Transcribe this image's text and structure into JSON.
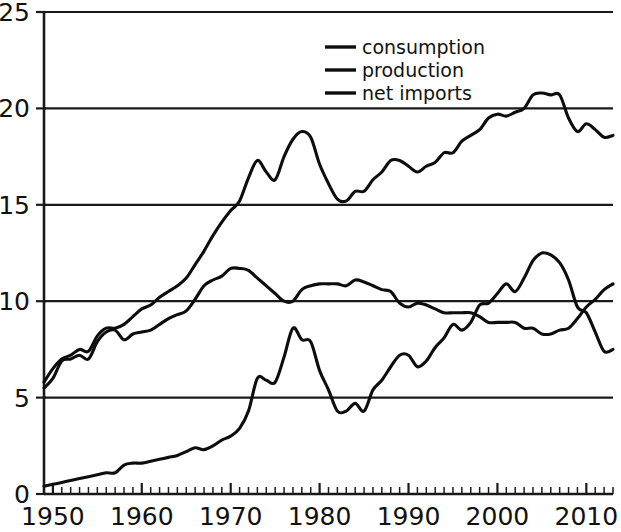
{
  "chart_data": {
    "type": "line",
    "title": "",
    "subtitle": "",
    "xlabel": "",
    "ylabel": "",
    "xlim": [
      1949,
      2013
    ],
    "ylim": [
      0,
      25
    ],
    "grid": true,
    "grid_axis": "y",
    "legend_position": "top-center",
    "y_ticks": [
      "0",
      "5",
      "10",
      "15",
      "20",
      "25"
    ],
    "y_tick_values": [
      0,
      5,
      10,
      15,
      20,
      25
    ],
    "x_ticks": [
      "1950",
      "1960",
      "1970",
      "1980",
      "1990",
      "2000",
      "2010"
    ],
    "x_tick_values": [
      1950,
      1960,
      1970,
      1980,
      1990,
      2000,
      2010
    ],
    "x_minor_tick_step": 1,
    "x": [
      1949,
      1950,
      1951,
      1952,
      1953,
      1954,
      1955,
      1956,
      1957,
      1958,
      1959,
      1960,
      1961,
      1962,
      1963,
      1964,
      1965,
      1966,
      1967,
      1968,
      1969,
      1970,
      1971,
      1972,
      1973,
      1974,
      1975,
      1976,
      1977,
      1978,
      1979,
      1980,
      1981,
      1982,
      1983,
      1984,
      1985,
      1986,
      1987,
      1988,
      1989,
      1990,
      1991,
      1992,
      1993,
      1994,
      1995,
      1996,
      1997,
      1998,
      1999,
      2000,
      2001,
      2002,
      2003,
      2004,
      2005,
      2006,
      2007,
      2008,
      2009,
      2010,
      2011,
      2012,
      2013
    ],
    "series": [
      {
        "name": "consumption",
        "color": "#0d0d0d",
        "values": [
          5.8,
          6.5,
          7.0,
          7.2,
          7.5,
          7.4,
          8.2,
          8.6,
          8.6,
          8.8,
          9.2,
          9.6,
          9.8,
          10.2,
          10.5,
          10.8,
          11.2,
          11.9,
          12.6,
          13.4,
          14.1,
          14.7,
          15.2,
          16.4,
          17.3,
          16.7,
          16.3,
          17.5,
          18.4,
          18.8,
          18.5,
          17.1,
          16.1,
          15.3,
          15.2,
          15.7,
          15.7,
          16.3,
          16.7,
          17.3,
          17.3,
          17.0,
          16.7,
          17.0,
          17.2,
          17.7,
          17.7,
          18.3,
          18.6,
          18.9,
          19.5,
          19.7,
          19.6,
          19.8,
          20.0,
          20.7,
          20.8,
          20.7,
          20.7,
          19.5,
          18.8,
          19.2,
          18.9,
          18.5,
          18.6
        ]
      },
      {
        "name": "production",
        "color": "#0d0d0d",
        "values": [
          5.5,
          6.0,
          6.9,
          7.0,
          7.2,
          7.0,
          7.9,
          8.4,
          8.5,
          8.0,
          8.3,
          8.4,
          8.5,
          8.8,
          9.1,
          9.3,
          9.5,
          10.1,
          10.8,
          11.1,
          11.3,
          11.7,
          11.7,
          11.6,
          11.2,
          10.8,
          10.4,
          10.0,
          10.0,
          10.6,
          10.8,
          10.9,
          10.9,
          10.9,
          10.8,
          11.1,
          11.0,
          10.8,
          10.6,
          10.5,
          9.9,
          9.7,
          9.9,
          9.8,
          9.6,
          9.4,
          9.4,
          9.4,
          9.4,
          9.2,
          8.9,
          8.9,
          8.9,
          8.9,
          8.6,
          8.6,
          8.3,
          8.3,
          8.5,
          8.6,
          9.1,
          9.7,
          10.1,
          10.6,
          10.9
        ]
      },
      {
        "name": "net imports",
        "color": "#0d0d0d",
        "values": [
          0.4,
          0.5,
          0.6,
          0.7,
          0.8,
          0.9,
          1.0,
          1.1,
          1.1,
          1.5,
          1.6,
          1.6,
          1.7,
          1.8,
          1.9,
          2.0,
          2.2,
          2.4,
          2.3,
          2.5,
          2.8,
          3.0,
          3.4,
          4.3,
          6.0,
          5.9,
          5.8,
          7.1,
          8.6,
          8.0,
          7.9,
          6.4,
          5.4,
          4.3,
          4.3,
          4.7,
          4.3,
          5.4,
          5.9,
          6.6,
          7.2,
          7.2,
          6.6,
          6.9,
          7.6,
          8.1,
          8.8,
          8.5,
          8.9,
          9.8,
          9.9,
          10.4,
          10.9,
          10.5,
          11.2,
          12.1,
          12.5,
          12.4,
          12.0,
          11.1,
          9.7,
          9.4,
          8.4,
          7.4,
          7.5
        ]
      }
    ]
  },
  "legend": {
    "entries": [
      {
        "label": "consumption"
      },
      {
        "label": "production"
      },
      {
        "label": "net imports"
      }
    ]
  }
}
